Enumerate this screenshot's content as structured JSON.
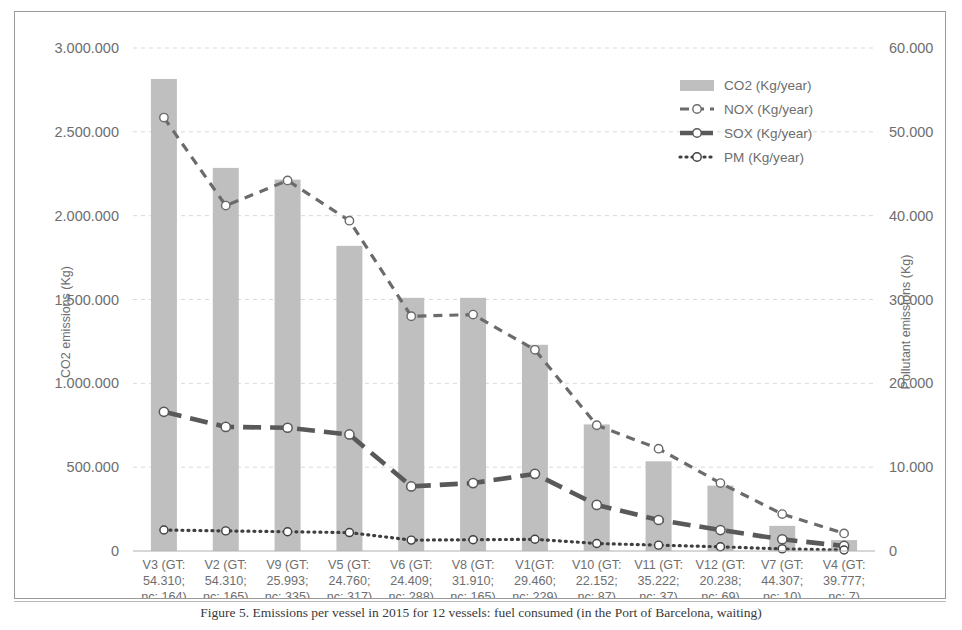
{
  "figure": {
    "caption": "Figure 5. Emissions per vessel in 2015 for 12 vessels: fuel consumed (in the Port of Barcelona, waiting)"
  },
  "axes": {
    "left_title": "CO2 emissions (Kg)",
    "right_title": "Pollutant emissions (Kg)",
    "left_ticks": [
      "0",
      "500.000",
      "1.000.000",
      "1.500.000",
      "2.000.000",
      "2.500.000",
      "3.000.000"
    ],
    "right_ticks": [
      "0",
      "10.000",
      "20.000",
      "30.000",
      "40.000",
      "50.000",
      "60.000"
    ]
  },
  "legend": {
    "items": [
      {
        "label": "CO2 (Kg/year)",
        "marker": "bar-swatch",
        "color": "#bfbfbf"
      },
      {
        "label": "NOX (Kg/year)",
        "marker": "dashed-line-circle",
        "color": "#6b6b6b"
      },
      {
        "label": "SOX (Kg/year)",
        "marker": "thick-dashed-line-circle",
        "color": "#595959"
      },
      {
        "label": "PM (Kg/year)",
        "marker": "dotted-line-circle",
        "color": "#3f3f3f"
      }
    ]
  },
  "chart_data": {
    "type": "bar",
    "title": "",
    "xlabel": "",
    "ylabel": "CO2 emissions (Kg)",
    "y2label": "Pollutant emissions (Kg)",
    "ylim": [
      0,
      3000000
    ],
    "y2lim": [
      0,
      60000
    ],
    "grid": true,
    "legend_position": "top-right",
    "categories": [
      "V3 (GT: 54.310; nc: 164)",
      "V2 (GT: 54.310; nc: 165)",
      "V9 (GT: 25.993; nc: 335)",
      "V5 (GT: 24.760; nc: 317)",
      "V6 (GT: 24.409; nc: 288)",
      "V8 (GT: 31.910; nc: 165)",
      "V1(GT: 29.460; nc: 229)",
      "V10 (GT: 22.152; nc: 87)",
      "V11 (GT: 35.222; nc: 37)",
      "V12 (GT: 20.238; nc: 69)",
      "V7 (GT: 44.307; nc: 10)",
      "V4 (GT: 39.777; nc: 7)"
    ],
    "category_lines": [
      [
        "V3 (GT:",
        "54.310;",
        "nc: 164)"
      ],
      [
        "V2 (GT:",
        "54.310;",
        "nc: 165)"
      ],
      [
        "V9 (GT:",
        "25.993;",
        "nc: 335)"
      ],
      [
        "V5 (GT:",
        "24.760;",
        "nc: 317)"
      ],
      [
        "V6 (GT:",
        "24.409;",
        "nc: 288)"
      ],
      [
        "V8 (GT:",
        "31.910;",
        "nc: 165)"
      ],
      [
        "V1(GT:",
        "29.460;",
        "nc: 229)"
      ],
      [
        "V10 (GT:",
        "22.152;",
        "nc: 87)"
      ],
      [
        "V11 (GT:",
        "35.222;",
        "nc: 37)"
      ],
      [
        "V12 (GT:",
        "20.238;",
        "nc: 69)"
      ],
      [
        "V7 (GT:",
        "44.307;",
        "nc: 10)"
      ],
      [
        "V4 (GT:",
        "39.777;",
        "nc: 7)"
      ]
    ],
    "series": [
      {
        "name": "CO2 (Kg/year)",
        "type": "bar",
        "axis": "left",
        "color": "#bfbfbf",
        "values": [
          2815000,
          2285000,
          2215000,
          1820000,
          1510000,
          1510000,
          1230000,
          755000,
          535000,
          390000,
          150000,
          65000
        ]
      },
      {
        "name": "NOX (Kg/year)",
        "type": "line",
        "axis": "right",
        "color": "#6b6b6b",
        "values": [
          51700,
          41200,
          44200,
          39400,
          28000,
          28200,
          24000,
          15000,
          12200,
          8100,
          4400,
          2100
        ]
      },
      {
        "name": "SOX (Kg/year)",
        "type": "line",
        "axis": "right",
        "color": "#595959",
        "values": [
          16600,
          14800,
          14700,
          13900,
          7700,
          8100,
          9200,
          5500,
          3700,
          2500,
          1400,
          600
        ]
      },
      {
        "name": "PM (Kg/year)",
        "type": "line",
        "axis": "right",
        "color": "#3f3f3f",
        "values": [
          2500,
          2400,
          2300,
          2200,
          1300,
          1350,
          1400,
          900,
          700,
          500,
          250,
          120
        ]
      }
    ]
  }
}
